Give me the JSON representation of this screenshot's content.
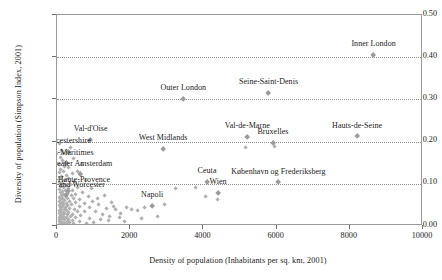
{
  "chart_data": {
    "type": "scatter",
    "title": "",
    "xlabel": "Density of population (Inhabitants per sq. km, 2001)",
    "ylabel": "Diversity of population (Simpson Index, 2001)",
    "xlim": [
      0,
      10000
    ],
    "ylim": [
      0.0,
      0.5
    ],
    "xticks": [
      "0",
      "2000",
      "4000",
      "6000",
      "8000",
      "10000"
    ],
    "xtick_values": [
      0,
      2000,
      4000,
      6000,
      8000,
      10000
    ],
    "yticks": [
      "0.00",
      "0.10",
      "0.20",
      "0.30",
      "0.40",
      "0.50"
    ],
    "ytick_values": [
      0.0,
      0.1,
      0.2,
      0.3,
      0.4,
      0.5
    ],
    "grid": "horizontal dotted at 0.10, 0.20, 0.30, 0.40",
    "legend": "none",
    "labeled_points": [
      {
        "name": "Inner London",
        "x": 8650,
        "y": 0.405,
        "label_dx": 0,
        "label_dy": -9
      },
      {
        "name": "Seine-Saint-Denis",
        "x": 5780,
        "y": 0.315,
        "label_dx": 0,
        "label_dy": -9
      },
      {
        "name": "Outer London",
        "x": 3450,
        "y": 0.3,
        "label_dx": 0,
        "label_dy": -9
      },
      {
        "name": "Hauts-de-Seine",
        "x": 8200,
        "y": 0.212,
        "label_dx": 0,
        "label_dy": -9
      },
      {
        "name": "Val-de-Marne",
        "x": 5200,
        "y": 0.21,
        "label_dx": 0,
        "label_dy": -9
      },
      {
        "name": "Bruxelles",
        "x": 5900,
        "y": 0.196,
        "label_dx": 0,
        "label_dy": -9
      },
      {
        "name": "Val-d'Oise",
        "x": 920,
        "y": 0.204,
        "label_dx": 0,
        "label_dy": -9
      },
      {
        "name": "West Midlands",
        "x": 2900,
        "y": 0.183,
        "label_dx": 0,
        "label_dy": -9
      },
      {
        "name": "Leicestershire",
        "x": 300,
        "y": 0.175,
        "label_dx": 0,
        "label_dy": -9
      },
      {
        "name": "Alpes-Maritimes",
        "x": 250,
        "y": 0.148,
        "label_dx": 0,
        "label_dy": -9
      },
      {
        "name": "Greater Amsterdam",
        "x": 640,
        "y": 0.122,
        "label_dx": 0,
        "label_dy": -9
      },
      {
        "name": "Ceuta",
        "x": 4100,
        "y": 0.104,
        "label_dx": 0,
        "label_dy": -9
      },
      {
        "name": "København og Frederiksberg",
        "x": 6050,
        "y": 0.103,
        "label_dx": 0,
        "label_dy": -9
      },
      {
        "name": "Alpes-de-Haute-Provence",
        "x": 300,
        "y": 0.083,
        "label_dx": 0,
        "label_dy": -9
      },
      {
        "name": "Wien",
        "x": 4400,
        "y": 0.078,
        "label_dx": 0,
        "label_dy": -9
      },
      {
        "name": "Hereford and Worcester",
        "x": 250,
        "y": 0.072,
        "label_dx": 0,
        "label_dy": -9
      },
      {
        "name": "Napoli",
        "x": 2600,
        "y": 0.047,
        "label_dx": 0,
        "label_dy": -9
      }
    ],
    "cloud_points": [
      {
        "x": 60,
        "y": 0.196
      },
      {
        "x": 120,
        "y": 0.178
      },
      {
        "x": 180,
        "y": 0.172
      },
      {
        "x": 90,
        "y": 0.163
      },
      {
        "x": 260,
        "y": 0.15
      },
      {
        "x": 140,
        "y": 0.155
      },
      {
        "x": 70,
        "y": 0.146
      },
      {
        "x": 210,
        "y": 0.141
      },
      {
        "x": 330,
        "y": 0.138
      },
      {
        "x": 110,
        "y": 0.133
      },
      {
        "x": 180,
        "y": 0.128
      },
      {
        "x": 60,
        "y": 0.126
      },
      {
        "x": 420,
        "y": 0.124
      },
      {
        "x": 250,
        "y": 0.12
      },
      {
        "x": 130,
        "y": 0.118
      },
      {
        "x": 640,
        "y": 0.122
      },
      {
        "x": 90,
        "y": 0.114
      },
      {
        "x": 310,
        "y": 0.112
      },
      {
        "x": 200,
        "y": 0.108
      },
      {
        "x": 480,
        "y": 0.106
      },
      {
        "x": 70,
        "y": 0.104
      },
      {
        "x": 150,
        "y": 0.1
      },
      {
        "x": 360,
        "y": 0.098
      },
      {
        "x": 260,
        "y": 0.096
      },
      {
        "x": 100,
        "y": 0.094
      },
      {
        "x": 560,
        "y": 0.092
      },
      {
        "x": 190,
        "y": 0.09
      },
      {
        "x": 330,
        "y": 0.088
      },
      {
        "x": 60,
        "y": 0.086
      },
      {
        "x": 430,
        "y": 0.085
      },
      {
        "x": 240,
        "y": 0.083
      },
      {
        "x": 140,
        "y": 0.081
      },
      {
        "x": 700,
        "y": 0.08
      },
      {
        "x": 90,
        "y": 0.078
      },
      {
        "x": 300,
        "y": 0.077
      },
      {
        "x": 180,
        "y": 0.075
      },
      {
        "x": 520,
        "y": 0.074
      },
      {
        "x": 120,
        "y": 0.072
      },
      {
        "x": 390,
        "y": 0.071
      },
      {
        "x": 230,
        "y": 0.069
      },
      {
        "x": 60,
        "y": 0.068
      },
      {
        "x": 850,
        "y": 0.07
      },
      {
        "x": 160,
        "y": 0.066
      },
      {
        "x": 450,
        "y": 0.065
      },
      {
        "x": 280,
        "y": 0.064
      },
      {
        "x": 100,
        "y": 0.062
      },
      {
        "x": 610,
        "y": 0.062
      },
      {
        "x": 200,
        "y": 0.06
      },
      {
        "x": 350,
        "y": 0.059
      },
      {
        "x": 75,
        "y": 0.058
      },
      {
        "x": 980,
        "y": 0.058
      },
      {
        "x": 140,
        "y": 0.056
      },
      {
        "x": 500,
        "y": 0.055
      },
      {
        "x": 260,
        "y": 0.054
      },
      {
        "x": 110,
        "y": 0.052
      },
      {
        "x": 760,
        "y": 0.053
      },
      {
        "x": 190,
        "y": 0.051
      },
      {
        "x": 400,
        "y": 0.05
      },
      {
        "x": 60,
        "y": 0.049
      },
      {
        "x": 1150,
        "y": 0.05
      },
      {
        "x": 300,
        "y": 0.048
      },
      {
        "x": 150,
        "y": 0.046
      },
      {
        "x": 620,
        "y": 0.046
      },
      {
        "x": 230,
        "y": 0.044
      },
      {
        "x": 90,
        "y": 0.043
      },
      {
        "x": 900,
        "y": 0.044
      },
      {
        "x": 350,
        "y": 0.042
      },
      {
        "x": 130,
        "y": 0.04
      },
      {
        "x": 480,
        "y": 0.04
      },
      {
        "x": 200,
        "y": 0.038
      },
      {
        "x": 70,
        "y": 0.037
      },
      {
        "x": 1350,
        "y": 0.042
      },
      {
        "x": 270,
        "y": 0.036
      },
      {
        "x": 110,
        "y": 0.034
      },
      {
        "x": 560,
        "y": 0.035
      },
      {
        "x": 170,
        "y": 0.032
      },
      {
        "x": 760,
        "y": 0.033
      },
      {
        "x": 320,
        "y": 0.031
      },
      {
        "x": 60,
        "y": 0.03
      },
      {
        "x": 1050,
        "y": 0.034
      },
      {
        "x": 220,
        "y": 0.029
      },
      {
        "x": 420,
        "y": 0.028
      },
      {
        "x": 130,
        "y": 0.027
      },
      {
        "x": 1600,
        "y": 0.038
      },
      {
        "x": 290,
        "y": 0.026
      },
      {
        "x": 90,
        "y": 0.024
      },
      {
        "x": 640,
        "y": 0.025
      },
      {
        "x": 180,
        "y": 0.023
      },
      {
        "x": 380,
        "y": 0.022
      },
      {
        "x": 60,
        "y": 0.021
      },
      {
        "x": 1250,
        "y": 0.026
      },
      {
        "x": 250,
        "y": 0.02
      },
      {
        "x": 120,
        "y": 0.019
      },
      {
        "x": 520,
        "y": 0.019
      },
      {
        "x": 160,
        "y": 0.017
      },
      {
        "x": 330,
        "y": 0.016
      },
      {
        "x": 80,
        "y": 0.015
      },
      {
        "x": 880,
        "y": 0.017
      },
      {
        "x": 210,
        "y": 0.014
      },
      {
        "x": 420,
        "y": 0.013
      },
      {
        "x": 110,
        "y": 0.012
      },
      {
        "x": 1450,
        "y": 0.022
      },
      {
        "x": 280,
        "y": 0.011
      },
      {
        "x": 60,
        "y": 0.01
      },
      {
        "x": 620,
        "y": 0.011
      },
      {
        "x": 170,
        "y": 0.009
      },
      {
        "x": 350,
        "y": 0.008
      },
      {
        "x": 100,
        "y": 0.007
      },
      {
        "x": 230,
        "y": 0.006
      },
      {
        "x": 450,
        "y": 0.006
      },
      {
        "x": 140,
        "y": 0.005
      },
      {
        "x": 70,
        "y": 0.004
      },
      {
        "x": 300,
        "y": 0.004
      },
      {
        "x": 190,
        "y": 0.003
      },
      {
        "x": 1750,
        "y": 0.03
      },
      {
        "x": 1900,
        "y": 0.044
      },
      {
        "x": 2050,
        "y": 0.04
      },
      {
        "x": 1550,
        "y": 0.046
      },
      {
        "x": 1700,
        "y": 0.02
      },
      {
        "x": 2200,
        "y": 0.036
      },
      {
        "x": 2400,
        "y": 0.043
      },
      {
        "x": 1400,
        "y": 0.012
      },
      {
        "x": 1200,
        "y": 0.015
      },
      {
        "x": 1000,
        "y": 0.008
      },
      {
        "x": 2750,
        "y": 0.022
      },
      {
        "x": 1850,
        "y": 0.01
      },
      {
        "x": 800,
        "y": 0.006
      },
      {
        "x": 950,
        "y": 0.088
      },
      {
        "x": 1100,
        "y": 0.066
      },
      {
        "x": 780,
        "y": 0.108
      },
      {
        "x": 560,
        "y": 0.13
      },
      {
        "x": 680,
        "y": 0.146
      },
      {
        "x": 460,
        "y": 0.16
      },
      {
        "x": 380,
        "y": 0.186
      },
      {
        "x": 1500,
        "y": 0.055
      },
      {
        "x": 3250,
        "y": 0.088
      },
      {
        "x": 3800,
        "y": 0.092
      },
      {
        "x": 4050,
        "y": 0.07
      },
      {
        "x": 4400,
        "y": 0.062
      },
      {
        "x": 5150,
        "y": 0.186
      },
      {
        "x": 5950,
        "y": 0.188
      },
      {
        "x": 2950,
        "y": 0.05
      },
      {
        "x": 2300,
        "y": 0.017
      },
      {
        "x": 1300,
        "y": 0.073
      }
    ]
  }
}
